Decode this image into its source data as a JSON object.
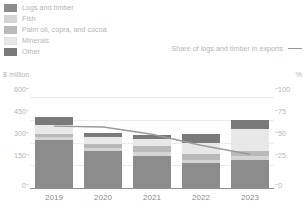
{
  "legend": {
    "items": [
      {
        "label": "Logs and timber",
        "color": "#8c8c8c"
      },
      {
        "label": "Fish",
        "color": "#d4d4d4"
      },
      {
        "label": "Palm oil, copra, and cocoa",
        "color": "#b9b9b9"
      },
      {
        "label": "Minerals",
        "color": "#e8e8e8"
      },
      {
        "label": "Other",
        "color": "#7a7a7a"
      }
    ],
    "line_series": {
      "label": "Share of logs and timber in exports",
      "color": "#9a9a9a"
    }
  },
  "axes": {
    "left_unit": "$ million",
    "right_unit": "%",
    "left_ticks": [
      "600",
      "450",
      "300",
      "150",
      "0"
    ],
    "right_ticks": [
      "100",
      "75",
      "50",
      "25",
      "0"
    ]
  },
  "chart_data": {
    "type": "bar",
    "title": "",
    "subtitle": "",
    "xlabel": "",
    "ylabel": "$ million",
    "y2label": "%",
    "ylim": [
      0,
      600
    ],
    "y2lim": [
      0,
      100
    ],
    "grid": true,
    "legend_position": "top-left",
    "stacked": true,
    "categories": [
      "2019",
      "2020",
      "2021",
      "2022",
      "2023"
    ],
    "series": [
      {
        "name": "Logs and timber",
        "color": "#8c8c8c",
        "values": [
          318,
          247,
          208,
          162,
          187
        ]
      },
      {
        "name": "Fish",
        "color": "#d4d4d4",
        "values": [
          16,
          16,
          28,
          24,
          22
        ]
      },
      {
        "name": "Palm oil, copra, and cocoa",
        "color": "#b9b9b9",
        "values": [
          24,
          30,
          42,
          36,
          34
        ]
      },
      {
        "name": "Minerals",
        "color": "#e8e8e8",
        "values": [
          58,
          45,
          45,
          78,
          148
        ]
      },
      {
        "name": "Other",
        "color": "#7a7a7a",
        "values": [
          54,
          27,
          27,
          55,
          59
        ]
      }
    ],
    "totals": [
      470,
      365,
      350,
      355,
      450
    ],
    "line_series": {
      "name": "Share of logs and timber in exports",
      "color": "#9a9a9a",
      "axis": "right",
      "unit": "%",
      "values": [
        68,
        67,
        59,
        47,
        37
      ]
    }
  }
}
